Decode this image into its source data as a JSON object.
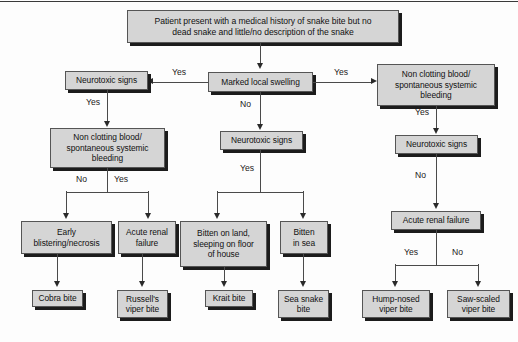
{
  "diagram": {
    "type": "flowchart",
    "colors": {
      "node_fill": "#d5d5d5",
      "node_border": "#555555",
      "node_shadow": "#1c1c1c",
      "connector": "#4a4a4a",
      "text": "#111111",
      "background": "#fdfdfd"
    }
  },
  "nodes": {
    "root": "Patient present with a medical history  of snake bite but no\ndead snake and little/no description of the snake",
    "marked_local_swelling": "Marked local swelling",
    "neuro_left": "Neurotoxic signs",
    "neuro_center": "Neurotoxic signs",
    "neuro_right": "Neurotoxic signs",
    "noncotting_right": "Non clotting blood/\nspontaneous systemic\nbleeding",
    "noncotting_left": "Non clotting blood/\nspontaneous systemic\nbleeding",
    "arf_left": "Acute renal\nfailure",
    "arf_right": "Acute renal failure",
    "early_blistering": "Early\nblistering/necrosis",
    "bitten_land": "Bitten on land,\nsleeping on floor\nof house",
    "bitten_sea": "Bitten\nin sea",
    "cobra_bite": "Cobra bite",
    "russells_viper_bite": "Russell's\nviper bite",
    "krait_bite": "Krait bite",
    "sea_snake_bite": "Sea snake\nbite",
    "hump_nosed_viper_bite": "Hump-nosed\nviper bite",
    "saw_scaled_viper_bite": "Saw-scaled\nviper bite"
  },
  "edge_labels": {
    "root_to_swelling": "",
    "swelling_yes_left": "Yes",
    "swelling_yes_right": "Yes",
    "swelling_no": "No",
    "neuro_left_yes": "Yes",
    "noncotting_right_yes": "Yes",
    "neuro_right_no": "No",
    "noncotting_left_no": "No",
    "noncotting_left_yes": "Yes",
    "neuro_center_yes": "Yes",
    "arf_right_yes": "Yes",
    "arf_right_no": "No"
  }
}
